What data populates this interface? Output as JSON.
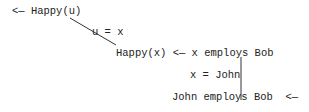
{
  "diagram": {
    "nodes": [
      {
        "id": "goal",
        "text": "<— Happy(u)"
      },
      {
        "id": "unify1",
        "text": "u = x"
      },
      {
        "id": "rule",
        "text": "Happy(x) <— x employs Bob"
      },
      {
        "id": "unify2",
        "text": "x = John"
      },
      {
        "id": "fact",
        "text": "John employs Bob  <—"
      }
    ],
    "edges": [
      {
        "from": "goal",
        "to": "rule",
        "label": "u = x",
        "style": "diagonal"
      },
      {
        "from": "rule",
        "to": "fact",
        "label": "x = John",
        "style": "vertical"
      }
    ],
    "line_color": "#333333"
  }
}
